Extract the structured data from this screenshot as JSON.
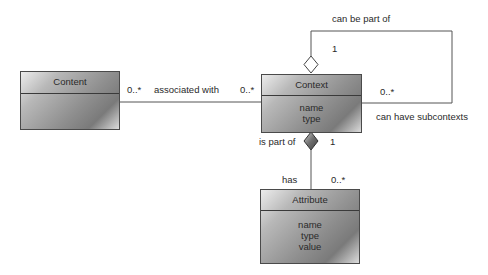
{
  "classes": {
    "content": {
      "name": "Content",
      "attributes": []
    },
    "context": {
      "name": "Context",
      "attributes": [
        "name",
        "type"
      ]
    },
    "attribute": {
      "name": "Attribute",
      "attributes": [
        "name",
        "type",
        "value"
      ]
    }
  },
  "associations": {
    "content_context": {
      "label": "associated with",
      "mult_content": "0..*",
      "mult_context": "0..*"
    },
    "self_context": {
      "label_top": "can be part of",
      "label_bottom": "can have subcontexts",
      "mult_whole": "1",
      "mult_part": "0..*",
      "kind": "aggregation"
    },
    "context_attribute": {
      "label_whole": "is part of",
      "label_part": "has",
      "mult_whole": "1",
      "mult_part": "0..*",
      "kind": "composition"
    }
  },
  "colors": {
    "line": "#555555",
    "box_border": "#4a4a4a",
    "text": "#2a2a2a"
  }
}
